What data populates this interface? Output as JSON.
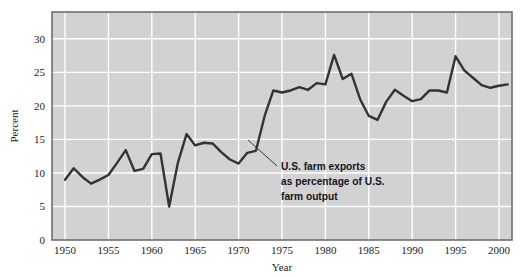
{
  "figure": {
    "background_color": "#ffffff",
    "plot_background_color": "#d2d2d2",
    "grid_color": "#ffffff",
    "line_color": "#333333",
    "frame_color": "#6e6e6e"
  },
  "axes": {
    "y_title": "Percent",
    "x_title": "Year",
    "y_ticks": [
      "0",
      "5",
      "10",
      "15",
      "20",
      "25",
      "30"
    ],
    "x_ticks": [
      "1950",
      "1955",
      "1960",
      "1965",
      "1970",
      "1975",
      "1980",
      "1985",
      "1990",
      "1995",
      "2000"
    ]
  },
  "annotation": {
    "line1": "U.S. farm exports",
    "line2": "as percentage of U.S.",
    "line3": "farm output"
  },
  "chart_data": {
    "type": "line",
    "title": "",
    "subtitle": "",
    "xlabel": "Year",
    "ylabel": "Percent",
    "xlim": [
      1948.5,
      2001.5
    ],
    "ylim": [
      0,
      34
    ],
    "grid": true,
    "legend": null,
    "annotations": [
      {
        "text": "U.S. farm exports as percentage of U.S. farm output",
        "points_to_year": 1972,
        "points_to_value": 13.3
      }
    ],
    "series": [
      {
        "name": "U.S. farm exports as percentage of U.S. farm output",
        "x": [
          1950,
          1951,
          1952,
          1953,
          1954,
          1955,
          1956,
          1957,
          1958,
          1959,
          1960,
          1961,
          1962,
          1963,
          1964,
          1965,
          1966,
          1967,
          1968,
          1969,
          1970,
          1971,
          1972,
          1973,
          1974,
          1975,
          1976,
          1977,
          1978,
          1979,
          1980,
          1981,
          1982,
          1983,
          1984,
          1985,
          1986,
          1987,
          1988,
          1989,
          1990,
          1991,
          1992,
          1993,
          1994,
          1995,
          1996,
          1997,
          1998,
          1999,
          2000,
          2001
        ],
        "values": [
          9.0,
          10.7,
          9.4,
          8.4,
          9.0,
          9.7,
          11.5,
          13.4,
          10.3,
          10.6,
          12.8,
          12.9,
          5.0,
          11.5,
          15.8,
          14.1,
          14.5,
          14.4,
          13.1,
          12.0,
          11.4,
          13.0,
          13.3,
          18.5,
          22.3,
          22.0,
          22.3,
          22.8,
          22.4,
          23.4,
          23.2,
          27.6,
          24.0,
          24.8,
          21.0,
          18.5,
          17.9,
          20.6,
          22.4,
          21.5,
          20.7,
          21.0,
          22.3,
          22.3,
          22.0,
          27.4,
          25.3,
          24.2,
          23.1,
          22.7,
          23.0,
          23.2
        ]
      }
    ]
  }
}
